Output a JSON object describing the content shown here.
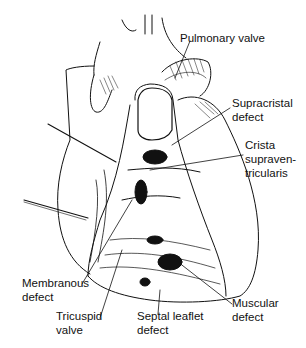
{
  "figure": {
    "style": "black ink line illustration on white"
  },
  "labels": {
    "pulmonary_valve": {
      "lines": [
        "Pulmonary valve"
      ]
    },
    "supracristal_defect": {
      "lines": [
        "Supracristal",
        "defect"
      ]
    },
    "crista_supraventricularis": {
      "lines": [
        "Crista",
        "supraven-",
        "tricularis"
      ]
    },
    "membranous_defect": {
      "lines": [
        "Membranous",
        "defect"
      ]
    },
    "tricuspid_valve": {
      "lines": [
        "Tricuspid",
        "valve"
      ]
    },
    "septal_leaflet_defect": {
      "lines": [
        "Septal leaflet",
        "defect"
      ]
    },
    "muscular_defect": {
      "lines": [
        "Muscular",
        "defect"
      ]
    }
  },
  "colors": {
    "ink": "#111111",
    "background": "#ffffff"
  }
}
